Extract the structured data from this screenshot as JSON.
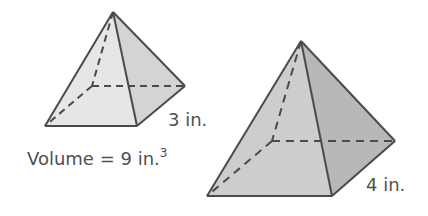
{
  "figures": [
    {
      "id": "small-pyramid",
      "shape": "square pyramid",
      "side_label": "3 in.",
      "volume_label": "Volume = 9 in.",
      "volume_exponent": "3"
    },
    {
      "id": "large-pyramid",
      "shape": "square pyramid",
      "side_label": "4 in."
    }
  ],
  "colors": {
    "small_front_face": "#e6e6e6",
    "small_side_face": "#d4d4d4",
    "large_front_face": "#cdcdcd",
    "large_side_face": "#b8b8b8",
    "edge": "#4a4a4a",
    "text": "#505050"
  }
}
